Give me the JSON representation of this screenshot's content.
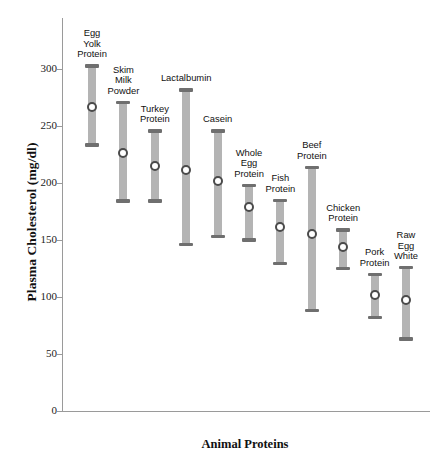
{
  "chart_data": {
    "type": "scatter",
    "title": "",
    "xlabel": "Animal Proteins",
    "ylabel": "Plasma Cholesterol (mg/dl)",
    "ylim": [
      0,
      320
    ],
    "yticks": [
      0,
      50,
      100,
      150,
      200,
      250,
      300
    ],
    "grid": false,
    "legend": "none",
    "marker_style": "open-circle",
    "error_style": "range-bar-with-caps",
    "colors": {
      "bar": "#b4b4b4",
      "cap": "#6f6f6f",
      "marker_edge": "#4a4a4a",
      "marker_fill": "#ffffff",
      "axis": "#9a9a9a",
      "text": "#111111"
    },
    "categories": [
      "Egg Yolk Protein",
      "Skim Milk Powder",
      "Turkey Protein",
      "Lactalbumin",
      "Casein",
      "Whole Egg Protein",
      "Fish Protein",
      "Beef Protein",
      "Chicken Protein",
      "Pork Protein",
      "Raw Egg White"
    ],
    "points": [
      {
        "label_lines": [
          "Egg",
          "Yolk",
          "Protein"
        ],
        "mean": 267,
        "low": 233,
        "high": 303
      },
      {
        "label_lines": [
          "Skim",
          "Milk",
          "Powder"
        ],
        "mean": 226,
        "low": 184,
        "high": 271
      },
      {
        "label_lines": [
          "Turkey",
          "Protein"
        ],
        "mean": 215,
        "low": 184,
        "high": 246
      },
      {
        "label_lines": [
          "Lactalbumin"
        ],
        "mean": 211,
        "low": 146,
        "high": 282
      },
      {
        "label_lines": [
          "Casein"
        ],
        "mean": 202,
        "low": 153,
        "high": 246
      },
      {
        "label_lines": [
          "Whole",
          "Egg",
          "Protein"
        ],
        "mean": 179,
        "low": 150,
        "high": 198
      },
      {
        "label_lines": [
          "Fish",
          "Protein"
        ],
        "mean": 161,
        "low": 129,
        "high": 185
      },
      {
        "label_lines": [
          "Beef",
          "Protein"
        ],
        "mean": 155,
        "low": 88,
        "high": 214
      },
      {
        "label_lines": [
          "Chicken",
          "Protein"
        ],
        "mean": 144,
        "low": 125,
        "high": 159
      },
      {
        "label_lines": [
          "Pork",
          "Protein"
        ],
        "mean": 102,
        "low": 82,
        "high": 120
      },
      {
        "label_lines": [
          "Raw",
          "Egg",
          "White"
        ],
        "mean": 97,
        "low": 63,
        "high": 126
      }
    ]
  }
}
